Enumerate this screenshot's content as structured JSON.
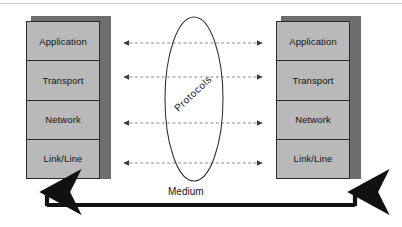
{
  "diagram": {
    "type": "network-layer-diagram",
    "colors": {
      "stack_face": "#b9b9b9",
      "stack_shadow": "#6e6e6e",
      "stack_border": "#2b2b2b",
      "arrow_dashed": "#8a8a8a",
      "arrow_solid": "#111111",
      "ellipse_stroke": "#2e2e2e",
      "page_rule": "#c9c9c9",
      "background": "#ffffff"
    }
  },
  "left_stack": {
    "name": "left-protocol-stack",
    "layers": [
      {
        "label": "Application"
      },
      {
        "label": "Transport"
      },
      {
        "label": "Network"
      },
      {
        "label": "Link/Line"
      }
    ]
  },
  "right_stack": {
    "name": "right-protocol-stack",
    "layers": [
      {
        "label": "Application"
      },
      {
        "label": "Transport"
      },
      {
        "label": "Network"
      },
      {
        "label": "Link/Line"
      }
    ]
  },
  "center": {
    "ellipse_label": "Protocols",
    "peer_arrows": [
      {
        "layer": "Application",
        "y": 43,
        "style": "dashed",
        "heads": "both"
      },
      {
        "layer": "Transport",
        "y": 77,
        "style": "dashed",
        "heads": "both"
      },
      {
        "layer": "Network",
        "y": 123,
        "style": "dashed",
        "heads": "both"
      },
      {
        "layer": "Link/Line",
        "y": 163,
        "style": "dashed",
        "heads": "both"
      }
    ]
  },
  "medium": {
    "label": "Medium",
    "style": "solid-thick",
    "heads": "both-up"
  }
}
